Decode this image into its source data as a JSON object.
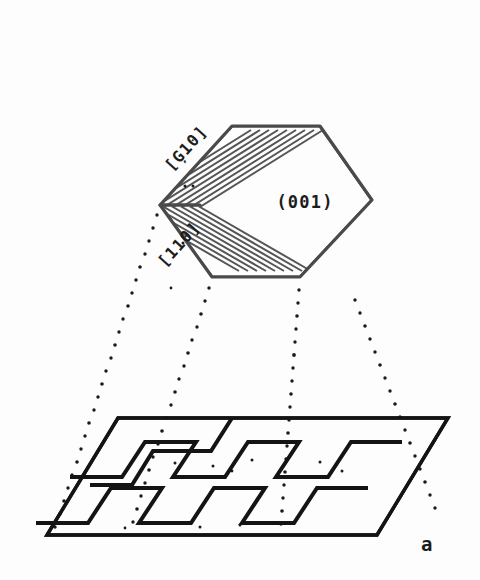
{
  "figure": {
    "panel_label": "a",
    "beam": {
      "label_line1": "e⁻ beam",
      "label_line2": "[100]",
      "arrow_direction": "down"
    },
    "crystal": {
      "face_label": "(001)",
      "edge_label_upper": "[Ģ10]",
      "edge_label_lower": "[110]",
      "lamella_count": 9,
      "shape": "hexagonal-platelet"
    },
    "substrate": {
      "step_rows": 2,
      "steps_per_row": 5,
      "shape": "parallelogram"
    },
    "colors": {
      "background": "#fdfdfd",
      "ink": "#141414",
      "crystal_edge": "#4a4a4a",
      "lamella": "#555555",
      "dot": "#1a1a1a"
    }
  }
}
